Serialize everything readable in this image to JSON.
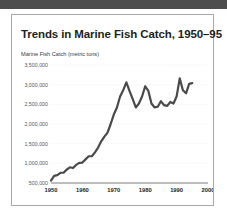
{
  "page": {
    "background_color": "#ffffff",
    "top_bar_color": "#4d4d4d",
    "card_border_color": "#a9a9a9"
  },
  "chart_data": {
    "type": "line",
    "title": "Trends in Marine Fish Catch, 1950–95",
    "subtitle": "Marine Fish Catch (metric tons)",
    "xlabel": "",
    "ylabel": "Marine Fish Catch (metric tons)",
    "xlim": [
      1950,
      2000
    ],
    "ylim": [
      500000,
      3500000
    ],
    "xticks": [
      1950,
      1960,
      1970,
      1980,
      1990,
      2000
    ],
    "xtick_labels": [
      "1950",
      "1960",
      "1970",
      "1980",
      "1990",
      "2000"
    ],
    "yticks": [
      500000,
      1000000,
      1500000,
      2000000,
      2500000,
      3000000,
      3500000
    ],
    "ytick_labels": [
      "500,000",
      "1,000,000",
      "1,500,000",
      "2,000,000",
      "2,500,000",
      "3,000,000",
      "3,500,000"
    ],
    "grid": true,
    "legend": false,
    "line_color": "#4a4a4a",
    "x": [
      1950,
      1951,
      1952,
      1953,
      1954,
      1955,
      1956,
      1957,
      1958,
      1959,
      1960,
      1961,
      1962,
      1963,
      1964,
      1965,
      1966,
      1967,
      1968,
      1969,
      1970,
      1971,
      1972,
      1973,
      1974,
      1975,
      1976,
      1977,
      1978,
      1979,
      1980,
      1981,
      1982,
      1983,
      1984,
      1985,
      1986,
      1987,
      1988,
      1989,
      1990,
      1991,
      1992,
      1993,
      1994,
      1995
    ],
    "values": [
      560000,
      680000,
      700000,
      760000,
      760000,
      840000,
      900000,
      880000,
      960000,
      1010000,
      1020000,
      1100000,
      1180000,
      1180000,
      1280000,
      1400000,
      1560000,
      1680000,
      1780000,
      2000000,
      2240000,
      2420000,
      2700000,
      2860000,
      3060000,
      2840000,
      2640000,
      2420000,
      2520000,
      2700000,
      2960000,
      2840000,
      2520000,
      2420000,
      2440000,
      2580000,
      2480000,
      2460000,
      2560000,
      2520000,
      2700000,
      3160000,
      2860000,
      2780000,
      3020000,
      3040000
    ]
  }
}
